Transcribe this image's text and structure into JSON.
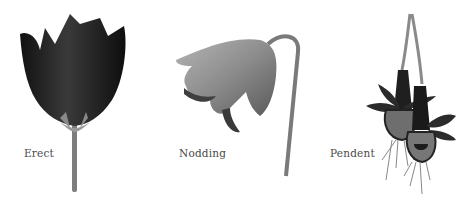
{
  "figure": {
    "panels": [
      {
        "id": "erect",
        "label": "Erect",
        "illustration": "erect-flower"
      },
      {
        "id": "nodding",
        "label": "Nodding",
        "illustration": "nodding-flower"
      },
      {
        "id": "pendent",
        "label": "Pendent",
        "illustration": "pendent-flower"
      }
    ],
    "colors": {
      "background": "#ffffff",
      "label_text": "#4a4a4a",
      "erect_petals": "#1e1e1e",
      "nodding_petals": "#8a8a8a",
      "pendent_petals": "#2a2a2a",
      "stem": "#7a7a7a"
    }
  }
}
